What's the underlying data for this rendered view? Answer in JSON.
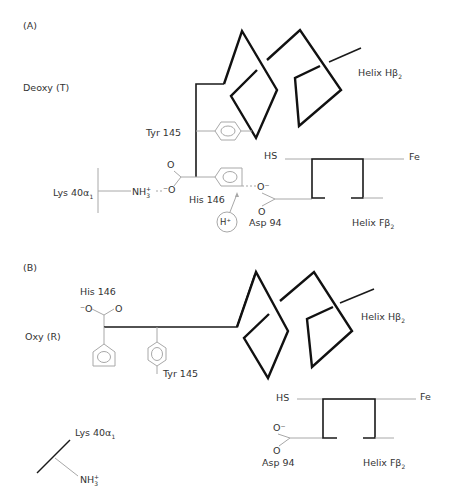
{
  "panels": {
    "a": {
      "tag": "(A)",
      "state": "Deoxy (T)",
      "tyr": "Tyr 145",
      "his": "His 146",
      "lys": "Lys 40α",
      "lys_sub": "1",
      "nh3": "NH",
      "nh3_sub": "3",
      "nh3_sup": "+",
      "o_top": "O",
      "o_minus": "⁻O",
      "asp_o_minus": "O⁻",
      "asp_o": "O",
      "asp": "Asp 94",
      "proton": "H⁺",
      "hs": "HS",
      "fe": "Fe",
      "helix_h": "Helix Hβ",
      "helix_h_sub": "2",
      "helix_f": "Helix Fβ",
      "helix_f_sub": "2"
    },
    "b": {
      "tag": "(B)",
      "state": "Oxy (R)",
      "his": "His 146",
      "o_minus": "⁻O",
      "o": "O",
      "tyr": "Tyr 145",
      "lys": "Lys 40α",
      "lys_sub": "1",
      "nh3": "NH",
      "nh3_sub": "3",
      "nh3_sup": "+",
      "asp_o_minus": "O⁻",
      "asp_o": "O",
      "asp": "Asp 94",
      "hs": "HS",
      "fe": "Fe",
      "helix_h": "Helix Hβ",
      "helix_h_sub": "2",
      "helix_f": "Helix Fβ",
      "helix_f_sub": "2"
    }
  }
}
